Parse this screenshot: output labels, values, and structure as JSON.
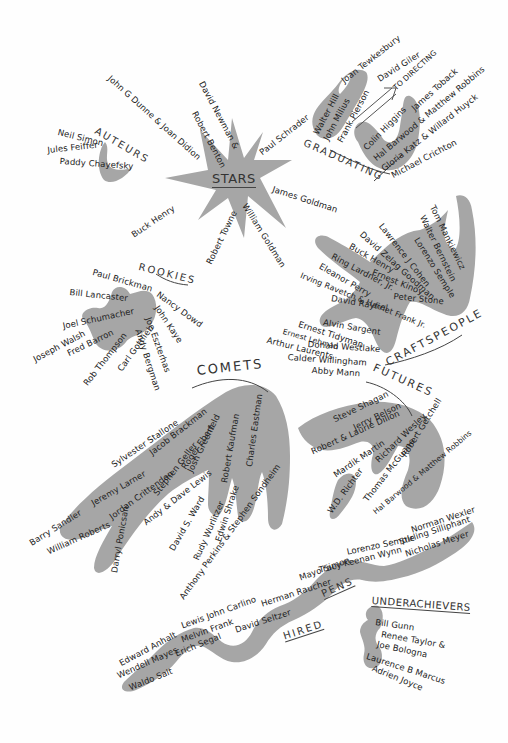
{
  "groups": {
    "stars": {
      "title": "STARS",
      "members": [
        "John G Dunne & Joan Didion",
        "David Newman &",
        "Robert Benton",
        "Paul Schrader",
        "James Goldman",
        "William Goldman",
        "Robert Towne",
        "Buck Henry"
      ]
    },
    "auteurs": {
      "title": "AUTEURS",
      "members": [
        "Neil Simon",
        "Jules Feiffer",
        "Paddy Chayefsky"
      ]
    },
    "graduating": {
      "title": "GRADUATING",
      "arrow_label": "TO DIRECTING",
      "members": [
        "Walter Hill",
        "John Milius",
        "Frank Pierson",
        "Joan Tewkesbury",
        "David Giler",
        "James Toback",
        "Colin Higgins",
        "Hal Barwood & Matthew Robbins",
        "Gloria Katz & Willard Huyck",
        "Michael Crichton"
      ]
    },
    "craftspeople": {
      "title": "CRAFTSPEOPLE",
      "members": [
        "Tom Mankiewicz",
        "Walter Bernstein",
        "Lawrence J Cohen",
        "Lorenzo Semple",
        "David Zelag Goodman",
        "Buck Henry",
        "Ring Lardner, Jr.",
        "Eleanor Perry",
        "Ernest Kinoy",
        "Peter Stone",
        "David Rayfiel",
        "Irving Ravetch & Harriet Frank Jr.",
        "Alvin Sargent",
        "Ernest Tidyman",
        "Ernest Lehman",
        "Arthur Laurents",
        "Donald Westlake",
        "Calder Willingham",
        "Abby Mann"
      ]
    },
    "rookies": {
      "title": "ROOKIES",
      "members": [
        "Paul Brickman",
        "Nancy Dowd",
        "Bill Lancaster",
        "John Kaye",
        "Joel Schumacher",
        "Joe Eszterhas",
        "Joseph Walsh",
        "Fred Barron",
        "Rob Thompson",
        "Carl Gottlieb",
        "Andy Bergman"
      ]
    },
    "comets": {
      "title": "COMETS",
      "members": [
        "Sylvester Stallone",
        "Jacob Brackman",
        "Jeremy Larner",
        "Jordan Crittenden",
        "Roger Ebert",
        "Stephen Geller",
        "Josh Greenfeld",
        "Robert Kaufman",
        "Charles Eastman",
        "Barry Sandler",
        "William Roberts",
        "Darryl Ponicsan",
        "Andy & Dave Lewis",
        "David S. Ward",
        "Rudy Wurlitzer",
        "Edwin Shrake",
        "Anthony Perkins & Stephen Sondheim"
      ]
    },
    "futures": {
      "title": "FUTURES",
      "members": [
        "Steve Shagan",
        "Jerry Belson",
        "Robert & Laurie Dillon",
        "Mardik Martin",
        "Richard Wesley",
        "Robert Getchell",
        "W.D. Richter",
        "Thomas McGuane",
        "Hal Barwood & Matthew Robbins"
      ]
    },
    "hired_pens": {
      "title_1": "HIRED",
      "title_2": "PENS",
      "members": [
        "Norman Wexler",
        "Stirling Silliphant",
        "Nicholas Meyer",
        "Lorenzo Semple",
        "Tracy Keenan Wynn",
        "Mayo Simon",
        "Herman Raucher",
        "Lewis John Carlino",
        "David Seltzer",
        "Melvin Frank",
        "Erich Segal",
        "Edward Anhalt",
        "Wendell Mayes",
        "Waldo Salt"
      ]
    },
    "underachievers": {
      "title": "UNDERACHIEVERS",
      "members": [
        "Bill Gunn",
        "Renee Taylor &",
        "Joe Bologna",
        "Laurence B Marcus",
        "Adrien Joyce"
      ]
    }
  },
  "colors": {
    "blob": "#a6a6a6",
    "ink": "#222222",
    "background": "#fefefe"
  }
}
